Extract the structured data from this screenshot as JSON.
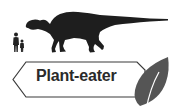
{
  "diet_label": "Plant-eater",
  "icons": {
    "dinosaur": "hadrosaur-silhouette-icon",
    "humans": "human-scale-figures-icon",
    "leaf": "leaf-icon"
  },
  "colors": {
    "silhouette": "#1e1e1e",
    "label_border": "#3a3a3a",
    "label_text": "#2a2a2a",
    "leaf": "#555555",
    "background": "#ffffff"
  }
}
